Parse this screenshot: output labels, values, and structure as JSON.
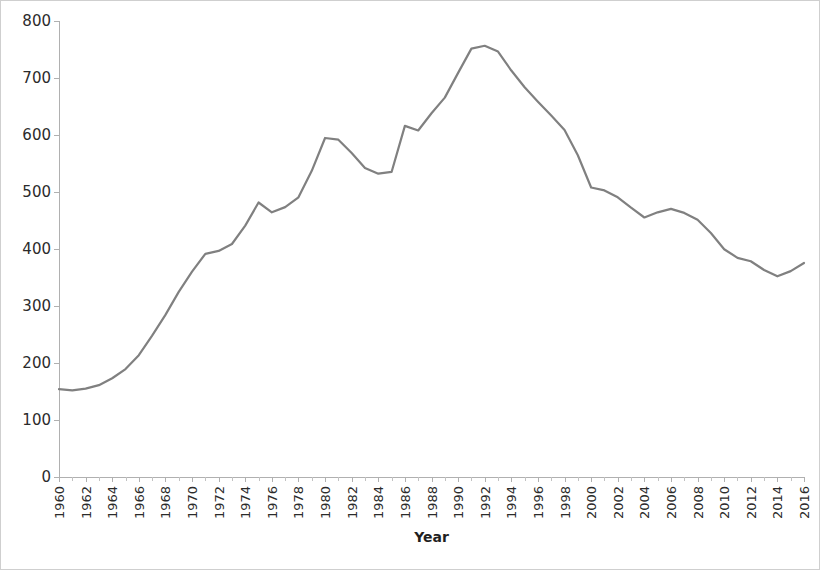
{
  "chart_data": {
    "type": "line",
    "title": "",
    "xlabel": "Year",
    "ylabel": "",
    "xlim": [
      1960,
      2016
    ],
    "ylim": [
      0,
      800
    ],
    "y_ticks": [
      0,
      100,
      200,
      300,
      400,
      500,
      600,
      700,
      800
    ],
    "x_ticks": [
      1960,
      1962,
      1964,
      1966,
      1968,
      1970,
      1972,
      1974,
      1976,
      1978,
      1980,
      1982,
      1984,
      1986,
      1988,
      1990,
      1992,
      1994,
      1996,
      1998,
      2000,
      2002,
      2004,
      2006,
      2008,
      2010,
      2012,
      2014,
      2016
    ],
    "grid": false,
    "legend": "none",
    "line_color": "#808080",
    "line_width": 2.2,
    "series": [
      {
        "name": "series-1",
        "x": [
          1960,
          1961,
          1962,
          1963,
          1964,
          1965,
          1966,
          1967,
          1968,
          1969,
          1970,
          1971,
          1972,
          1973,
          1974,
          1975,
          1976,
          1977,
          1978,
          1979,
          1980,
          1981,
          1982,
          1983,
          1984,
          1985,
          1986,
          1987,
          1988,
          1989,
          1990,
          1991,
          1992,
          1993,
          1994,
          1995,
          1996,
          1997,
          1998,
          1999,
          2000,
          2001,
          2002,
          2003,
          2004,
          2005,
          2006,
          2007,
          2008,
          2009,
          2010,
          2011,
          2012,
          2013,
          2014,
          2015,
          2016
        ],
        "values": [
          161,
          159,
          162,
          168,
          180,
          196,
          220,
          254,
          290,
          330,
          365,
          396,
          401,
          413,
          445,
          485,
          468,
          477,
          494,
          540,
          597,
          594,
          571,
          545,
          535,
          538,
          618,
          610,
          640,
          667,
          710,
          752,
          757,
          747,
          714,
          685,
          660,
          636,
          611,
          567,
          511,
          506,
          494,
          476,
          459,
          468,
          474,
          467,
          455,
          432,
          404,
          389,
          383,
          368,
          357,
          366,
          380
        ]
      }
    ]
  },
  "axis": {
    "x_title": "Year"
  }
}
